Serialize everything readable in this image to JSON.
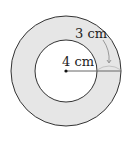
{
  "diagram": {
    "type": "annulus",
    "labels": {
      "inner_radius": "4 cm",
      "ring_width": "3 cm"
    },
    "colors": {
      "ring_fill": "#e6e6e6",
      "stroke": "#333333",
      "inner_fill": "#ffffff"
    }
  }
}
